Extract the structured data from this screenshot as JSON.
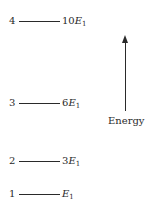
{
  "diagram": {
    "type": "energy-level-diagram",
    "axis_label": "Energy",
    "levels": [
      {
        "n": "4",
        "energy_coef": "10",
        "energy_symbol": "E",
        "energy_sub": "1"
      },
      {
        "n": "3",
        "energy_coef": "6",
        "energy_symbol": "E",
        "energy_sub": "1"
      },
      {
        "n": "2",
        "energy_coef": "3",
        "energy_symbol": "E",
        "energy_sub": "1"
      },
      {
        "n": "1",
        "energy_coef": "",
        "energy_symbol": "E",
        "energy_sub": "1"
      }
    ]
  }
}
